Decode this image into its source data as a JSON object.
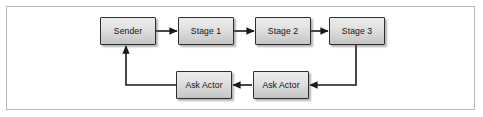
{
  "figure": {
    "frame": {
      "border_color": "#b9b9b9",
      "background": "#ffffff"
    },
    "style": {
      "node_border_color": "#2e2e2e",
      "node_fill_top": "#ececec",
      "node_fill_bottom": "#c4c4c4",
      "arrow_color": "#1a1a1a",
      "text_color": "#121212"
    }
  },
  "nodes": [
    {
      "id": "sender",
      "label": "Sender",
      "x": 100,
      "y": 17,
      "w": 56,
      "h": 28
    },
    {
      "id": "stage1",
      "label": "Stage 1",
      "x": 178,
      "y": 17,
      "w": 56,
      "h": 28
    },
    {
      "id": "stage2",
      "label": "Stage 2",
      "x": 255,
      "y": 17,
      "w": 56,
      "h": 28
    },
    {
      "id": "stage3",
      "label": "Stage 3",
      "x": 329,
      "y": 17,
      "w": 56,
      "h": 28
    },
    {
      "id": "askactor1",
      "label": "Ask Actor",
      "x": 176,
      "y": 71,
      "w": 56,
      "h": 28
    },
    {
      "id": "askactor2",
      "label": "Ask Actor",
      "x": 253,
      "y": 71,
      "w": 56,
      "h": 28
    }
  ],
  "edges": [
    {
      "id": "sender-to-stage1",
      "from": "sender",
      "to": "stage1",
      "type": "arrow-right"
    },
    {
      "id": "stage1-to-stage2",
      "from": "stage1",
      "to": "stage2",
      "type": "arrow-right"
    },
    {
      "id": "stage2-to-stage3",
      "from": "stage2",
      "to": "stage3",
      "type": "arrow-right"
    },
    {
      "id": "stage3-to-askactor2",
      "from": "stage3",
      "to": "askactor2",
      "type": "elbow-down-left-arrow"
    },
    {
      "id": "askactor2-to-askactor1",
      "from": "askactor2",
      "to": "askactor1",
      "type": "arrow-left"
    },
    {
      "id": "askactor1-to-sender",
      "from": "askactor1",
      "to": "sender",
      "type": "elbow-left-up-arrow"
    }
  ]
}
